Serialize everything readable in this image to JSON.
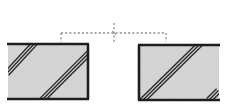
{
  "diagram": {
    "type": "section-detail",
    "colors": {
      "background": "#ffffff",
      "fill": "#d6d6d6",
      "outline": "#1e1e1e",
      "hatch": "#2a2a2a",
      "dotted_line": "#8a8a8a"
    },
    "blocks": [
      {
        "id": "left-block",
        "x": 8,
        "y": 44,
        "width": 80,
        "height": 55,
        "borders": [
          "top",
          "right",
          "bottom"
        ],
        "hatches": [
          {
            "x1": 8,
            "y1": 72,
            "x2": 34,
            "y2": 44
          },
          {
            "x1": 43,
            "y1": 99,
            "x2": 88,
            "y2": 54
          }
        ]
      },
      {
        "id": "right-block",
        "x": 139,
        "y": 45,
        "width": 80,
        "height": 55,
        "borders": [
          "top",
          "left",
          "bottom"
        ],
        "hatches": [
          {
            "x1": 143,
            "y1": 100,
            "x2": 199,
            "y2": 45
          },
          {
            "x1": 209,
            "y1": 100,
            "x2": 218,
            "y2": 91
          }
        ]
      }
    ],
    "reference_line": {
      "x1": 61,
      "x2": 166,
      "y": 33,
      "end_tick_bottom": 42,
      "center_marker": {
        "x": 114,
        "y_top": 23,
        "y_bottom": 43
      }
    }
  }
}
